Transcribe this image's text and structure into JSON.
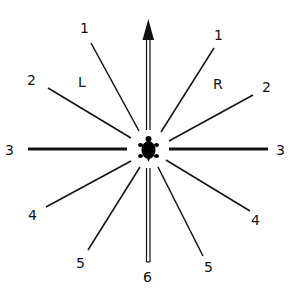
{
  "diagram": {
    "center_icon": "turtle-icon",
    "side_labels": {
      "left": "L",
      "right": "R"
    },
    "rays": [
      {
        "id": "up",
        "label": "",
        "style": "arrow-double"
      },
      {
        "id": "left-1",
        "label": "1"
      },
      {
        "id": "left-2",
        "label": "2"
      },
      {
        "id": "left-3",
        "label": "3",
        "style": "thick"
      },
      {
        "id": "left-4",
        "label": "4"
      },
      {
        "id": "left-5",
        "label": "5"
      },
      {
        "id": "down-6",
        "label": "6",
        "style": "double"
      },
      {
        "id": "right-5",
        "label": "5"
      },
      {
        "id": "right-4",
        "label": "4"
      },
      {
        "id": "right-3",
        "label": "3",
        "style": "thick"
      },
      {
        "id": "right-2",
        "label": "2"
      },
      {
        "id": "right-1",
        "label": "1"
      }
    ]
  }
}
